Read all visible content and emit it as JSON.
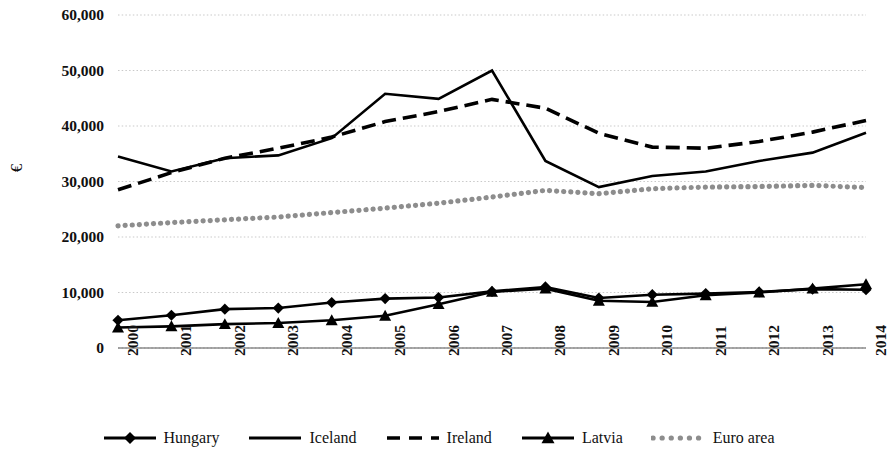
{
  "chart_data": {
    "type": "line",
    "title": "",
    "xlabel": "",
    "ylabel": "€",
    "ylim": [
      0,
      60000
    ],
    "ytick_labels": [
      "60,000",
      "50,000",
      "40,000",
      "30,000",
      "20,000",
      "10,000",
      "0"
    ],
    "ytick_values": [
      60000,
      50000,
      40000,
      30000,
      20000,
      10000,
      0
    ],
    "grid": true,
    "grid_axis": "y",
    "legend_position": "bottom",
    "x": [
      "2000",
      "2001",
      "2002",
      "2003",
      "2004",
      "2005",
      "2006",
      "2007",
      "2008",
      "2009",
      "2010",
      "2011",
      "2012",
      "2013",
      "2014"
    ],
    "categories": [
      "2000",
      "2001",
      "2002",
      "2003",
      "2004",
      "2005",
      "2006",
      "2007",
      "2008",
      "2009",
      "2010",
      "2011",
      "2012",
      "2013",
      "2014"
    ],
    "series": [
      {
        "name": "Hungary",
        "style": "solid",
        "marker": "diamond",
        "color": "#000000",
        "values": [
          5000,
          5900,
          7000,
          7200,
          8200,
          8900,
          9100,
          10200,
          11000,
          9000,
          9600,
          9800,
          10100,
          10600,
          10500
        ]
      },
      {
        "name": "Iceland",
        "style": "solid",
        "marker": "none",
        "color": "#000000",
        "values": [
          34500,
          31800,
          34200,
          34700,
          37800,
          45800,
          44900,
          50000,
          33700,
          29000,
          31000,
          31800,
          33700,
          35200,
          38800
        ]
      },
      {
        "name": "Ireland",
        "style": "dashed",
        "marker": "none",
        "color": "#000000",
        "values": [
          28500,
          31600,
          34200,
          36000,
          38000,
          40800,
          42600,
          44800,
          43200,
          38700,
          36200,
          36000,
          37200,
          38900,
          41000
        ]
      },
      {
        "name": "Latvia",
        "style": "solid",
        "marker": "triangle",
        "color": "#000000",
        "values": [
          3700,
          3900,
          4300,
          4500,
          5000,
          5800,
          7900,
          10100,
          10700,
          8500,
          8300,
          9500,
          10000,
          10700,
          11500
        ]
      },
      {
        "name": "Euro area",
        "style": "dotted",
        "marker": "none",
        "color": "#8d8d8d",
        "values": [
          22000,
          22600,
          23100,
          23600,
          24400,
          25200,
          26100,
          27200,
          28400,
          27800,
          28700,
          29000,
          29100,
          29300,
          28900
        ]
      }
    ]
  },
  "axis": {
    "y_title": "€"
  },
  "legend": {
    "items": [
      {
        "label": "Hungary"
      },
      {
        "label": "Iceland"
      },
      {
        "label": "Ireland"
      },
      {
        "label": "Latvia"
      },
      {
        "label": "Euro area"
      }
    ]
  }
}
